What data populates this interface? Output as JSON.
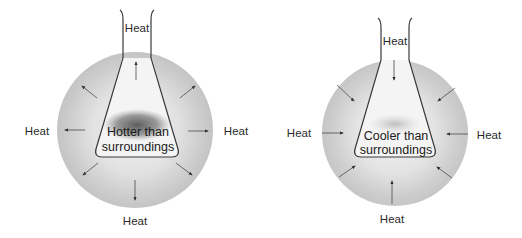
{
  "diagrams": [
    {
      "id": "exothermic",
      "flask_label_line1": "Hotter than",
      "flask_label_line2": "surroundings",
      "heat_flow": "outward",
      "labels": {
        "top": "Heat",
        "left": "Heat",
        "right": "Heat",
        "bottom": "Heat"
      },
      "colors": {
        "sphere": "#cfcfcf",
        "core": "#6e6e6e",
        "stroke": "#3a3a3a"
      }
    },
    {
      "id": "endothermic",
      "flask_label_line1": "Cooler than",
      "flask_label_line2": "surroundings",
      "heat_flow": "inward",
      "labels": {
        "top": "Heat",
        "left": "Heat",
        "right": "Heat",
        "bottom": "Heat"
      },
      "colors": {
        "sphere": "#cfcfcf",
        "core": "#b5b5b5",
        "stroke": "#3a3a3a"
      }
    }
  ]
}
